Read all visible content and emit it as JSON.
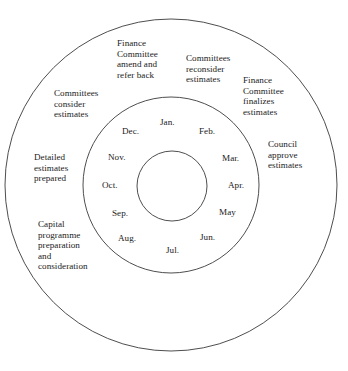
{
  "diagram": {
    "background_color": "#ffffff",
    "stroke_color": "#3a3a3a",
    "text_color": "#1a1a1a",
    "rings": [
      {
        "name": "outer-ring",
        "cx": 171,
        "cy": 185,
        "r": 166
      },
      {
        "name": "middle-ring",
        "cx": 171,
        "cy": 185,
        "r": 88
      },
      {
        "name": "inner-ring",
        "cx": 172,
        "cy": 186,
        "r": 35
      }
    ],
    "outer_ring_labels": [
      {
        "id": "finance-committee-amend",
        "text": "Finance\nCommittee\namend and\nrefer back",
        "x": 117,
        "y": 38,
        "align": "left"
      },
      {
        "id": "committees-reconsider",
        "text": "Committees\nreconsider\nestimates",
        "x": 186,
        "y": 53,
        "align": "left"
      },
      {
        "id": "finance-committee-finalizes",
        "text": "Finance\nCommittee\nfinalizes\nestimates",
        "x": 243,
        "y": 75,
        "align": "left"
      },
      {
        "id": "committees-consider",
        "text": "Committees\nconsider\nestimates",
        "x": 54,
        "y": 88,
        "align": "left"
      },
      {
        "id": "council-approve",
        "text": "Council\napprove\nestimates",
        "x": 268,
        "y": 139,
        "align": "left"
      },
      {
        "id": "detailed-estimates-prepared",
        "text": "Detailed\nestimates\nprepared",
        "x": 34,
        "y": 152,
        "align": "left"
      },
      {
        "id": "capital-programme",
        "text": "Capital\nprogramme\npreparation\nand\nconsideration",
        "x": 38,
        "y": 219,
        "align": "left"
      }
    ],
    "month_labels": [
      {
        "id": "month-jan",
        "text": "Jan.",
        "x": 160,
        "y": 117
      },
      {
        "id": "month-feb",
        "text": "Feb.",
        "x": 199,
        "y": 126
      },
      {
        "id": "month-mar",
        "text": "Mar.",
        "x": 222,
        "y": 153
      },
      {
        "id": "month-apr",
        "text": "Apr.",
        "x": 228,
        "y": 180
      },
      {
        "id": "month-may",
        "text": "May",
        "x": 219,
        "y": 207
      },
      {
        "id": "month-jun",
        "text": "Jun.",
        "x": 200,
        "y": 232
      },
      {
        "id": "month-jul",
        "text": "Jul.",
        "x": 166,
        "y": 245
      },
      {
        "id": "month-aug",
        "text": "Aug.",
        "x": 118,
        "y": 233
      },
      {
        "id": "month-sep",
        "text": "Sep.",
        "x": 112,
        "y": 208
      },
      {
        "id": "month-oct",
        "text": "Oct.",
        "x": 102,
        "y": 180
      },
      {
        "id": "month-nov",
        "text": "Nov.",
        "x": 108,
        "y": 152
      },
      {
        "id": "month-dec",
        "text": "Dec.",
        "x": 122,
        "y": 126
      }
    ]
  }
}
